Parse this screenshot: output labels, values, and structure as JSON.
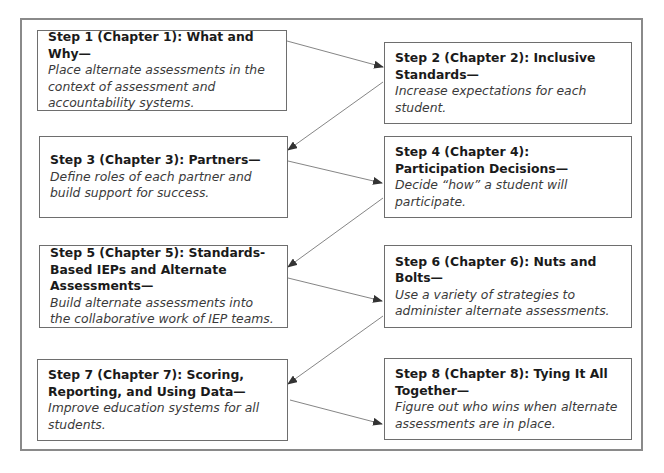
{
  "diagram": {
    "type": "flowchart",
    "layout": "zigzag two columns",
    "colors": {
      "frame_border": "#8a8a8a",
      "box_border": "#6e6e6e",
      "arrow": "#555555",
      "title_text": "#1a1a1a",
      "desc_text": "#3a3a3a"
    },
    "steps": [
      {
        "id": 1,
        "title": "Step 1 (Chapter 1): What and Why—",
        "description": "Place alternate assessments in the context of assessment and accountability systems."
      },
      {
        "id": 2,
        "title": "Step 2 (Chapter 2): Inclusive Standards—",
        "description": "Increase expectations for each student."
      },
      {
        "id": 3,
        "title": "Step 3 (Chapter 3): Partners—",
        "description": "Define roles of each partner and build support for success."
      },
      {
        "id": 4,
        "title": "Step 4 (Chapter 4): Participation Decisions—",
        "description": "Decide “how” a student will participate."
      },
      {
        "id": 5,
        "title": "Step 5 (Chapter 5): Standards-Based IEPs and Alternate Assessments—",
        "description": "Build alternate assessments into the collaborative work of IEP teams."
      },
      {
        "id": 6,
        "title": "Step 6 (Chapter 6): Nuts and Bolts—",
        "description": "Use a variety of strategies to administer alternate assessments."
      },
      {
        "id": 7,
        "title": "Step 7 (Chapter 7): Scoring, Reporting, and Using Data—",
        "description": "Improve education systems for all students."
      },
      {
        "id": 8,
        "title": "Step 8 (Chapter 8): Tying It All Together—",
        "description": "Figure out who wins when alternate assessments are in place."
      }
    ],
    "connections": [
      {
        "from": 1,
        "to": 2
      },
      {
        "from": 2,
        "to": 3
      },
      {
        "from": 3,
        "to": 4
      },
      {
        "from": 4,
        "to": 5
      },
      {
        "from": 5,
        "to": 6
      },
      {
        "from": 6,
        "to": 7
      },
      {
        "from": 7,
        "to": 8
      }
    ]
  }
}
